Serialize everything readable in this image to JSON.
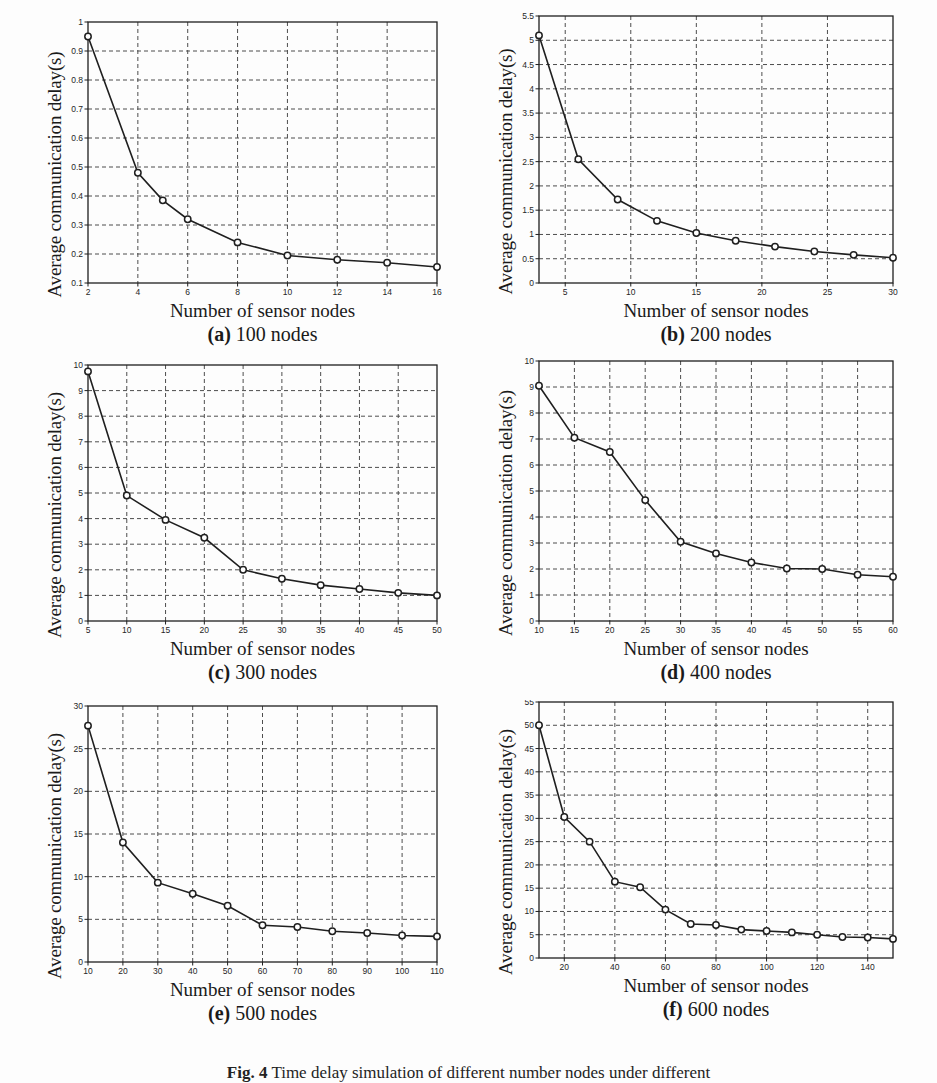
{
  "figure": {
    "caption_label": "Fig. 4",
    "caption_text": "Time delay simulation of different number nodes under different ",
    "background": "#fdfdfd",
    "line_color": "#1f1f1f",
    "grid_color": "#4d4d4d"
  },
  "common": {
    "xlabel": "Number of sensor nodes",
    "ylabel": "Average communication delay(s)"
  },
  "chart_data": [
    {
      "type": "line",
      "panel": "a",
      "sublabel_prefix": "(a)",
      "sublabel_text": " 100 nodes",
      "title": "100 nodes",
      "xlabel": "Number of sensor nodes",
      "ylabel": "Average communication delay(s)",
      "x": [
        2,
        4,
        5,
        6,
        8,
        10,
        12,
        14,
        16
      ],
      "values": [
        0.95,
        0.48,
        0.385,
        0.32,
        0.24,
        0.195,
        0.18,
        0.17,
        0.155
      ],
      "xlim": [
        2,
        16
      ],
      "ylim": [
        0.1,
        1
      ],
      "xticks": [
        2,
        4,
        6,
        8,
        10,
        12,
        14,
        16
      ],
      "xticklabels": [
        "2",
        "4",
        "6",
        "8",
        "10",
        "12",
        "14",
        "16"
      ],
      "yticks": [
        0.1,
        0.2,
        0.3,
        0.4,
        0.5,
        0.6,
        0.7,
        0.8,
        0.9,
        1
      ],
      "yticklabels": [
        "0.1",
        "0.2",
        "0.3",
        "0.4",
        "0.5",
        "0.6",
        "0.7",
        "0.8",
        "0.9",
        "1"
      ],
      "grid": true,
      "marker": "circle",
      "legend": null
    },
    {
      "type": "line",
      "panel": "b",
      "sublabel_prefix": "(b)",
      "sublabel_text": " 200 nodes",
      "title": "200 nodes",
      "xlabel": "Number of sensor nodes",
      "ylabel": "Average communication delay(s)",
      "x": [
        3,
        6,
        9,
        12,
        15,
        18,
        21,
        24,
        27,
        30
      ],
      "values": [
        5.1,
        2.55,
        1.72,
        1.28,
        1.03,
        0.87,
        0.75,
        0.65,
        0.58,
        0.52
      ],
      "xlim": [
        3,
        30
      ],
      "ylim": [
        0,
        5.5
      ],
      "xticks": [
        5,
        10,
        15,
        20,
        25,
        30
      ],
      "xticklabels": [
        "5",
        "10",
        "15",
        "20",
        "25",
        "30"
      ],
      "yticks": [
        0,
        0.5,
        1,
        1.5,
        2,
        2.5,
        3,
        3.5,
        4,
        4.5,
        5,
        5.5
      ],
      "yticklabels": [
        "0",
        "0.5",
        "1",
        "1.5",
        "2",
        "2.5",
        "3",
        "3.5",
        "4",
        "4.5",
        "5",
        "5.5"
      ],
      "grid": true,
      "marker": "circle",
      "legend": null
    },
    {
      "type": "line",
      "panel": "c",
      "sublabel_prefix": "(c)",
      "sublabel_text": " 300 nodes",
      "title": "300 nodes",
      "xlabel": "Number of sensor nodes",
      "ylabel": "Average communication delay(s)",
      "x": [
        5,
        10,
        15,
        20,
        25,
        30,
        35,
        40,
        45,
        50
      ],
      "values": [
        9.75,
        4.9,
        3.95,
        3.25,
        2.0,
        1.65,
        1.4,
        1.25,
        1.1,
        1.0
      ],
      "xlim": [
        5,
        50
      ],
      "ylim": [
        0,
        10
      ],
      "xticks": [
        5,
        10,
        15,
        20,
        25,
        30,
        35,
        40,
        45,
        50
      ],
      "xticklabels": [
        "5",
        "10",
        "15",
        "20",
        "25",
        "30",
        "35",
        "40",
        "45",
        "50"
      ],
      "yticks": [
        0,
        1,
        2,
        3,
        4,
        5,
        6,
        7,
        8,
        9,
        10
      ],
      "yticklabels": [
        "0",
        "1",
        "2",
        "3",
        "4",
        "5",
        "6",
        "7",
        "8",
        "9",
        "10"
      ],
      "grid": true,
      "marker": "circle",
      "legend": null
    },
    {
      "type": "line",
      "panel": "d",
      "sublabel_prefix": "(d)",
      "sublabel_text": " 400 nodes",
      "title": "400 nodes",
      "xlabel": "Number of sensor nodes",
      "ylabel": "Average communication delay(s)",
      "x": [
        10,
        15,
        20,
        25,
        30,
        35,
        40,
        45,
        50,
        55,
        60
      ],
      "values": [
        9.05,
        7.05,
        6.5,
        4.65,
        3.05,
        2.6,
        2.25,
        2.02,
        2.0,
        1.78,
        1.7
      ],
      "xlim": [
        10,
        60
      ],
      "ylim": [
        0,
        10
      ],
      "xticks": [
        10,
        15,
        20,
        25,
        30,
        35,
        40,
        45,
        50,
        55,
        60
      ],
      "xticklabels": [
        "10",
        "15",
        "20",
        "25",
        "30",
        "35",
        "40",
        "45",
        "50",
        "55",
        "60"
      ],
      "yticks": [
        0,
        1,
        2,
        3,
        4,
        5,
        6,
        7,
        8,
        9,
        10
      ],
      "yticklabels": [
        "0",
        "1",
        "2",
        "3",
        "4",
        "5",
        "6",
        "7",
        "8",
        "9",
        "10"
      ],
      "grid": true,
      "marker": "circle",
      "legend": null
    },
    {
      "type": "line",
      "panel": "e",
      "sublabel_prefix": "(e)",
      "sublabel_text": " 500 nodes",
      "title": "500 nodes",
      "xlabel": "Number of sensor nodes",
      "ylabel": "Average communication delay(s)",
      "x": [
        10,
        20,
        30,
        40,
        50,
        60,
        70,
        80,
        90,
        100,
        110
      ],
      "values": [
        27.7,
        14.0,
        9.3,
        8.0,
        6.6,
        4.3,
        4.1,
        3.6,
        3.4,
        3.1,
        3.0
      ],
      "xlim": [
        10,
        110
      ],
      "ylim": [
        0,
        30
      ],
      "xticks": [
        10,
        20,
        30,
        40,
        50,
        60,
        70,
        80,
        90,
        100,
        110
      ],
      "xticklabels": [
        "10",
        "20",
        "30",
        "40",
        "50",
        "60",
        "70",
        "80",
        "90",
        "100",
        "110"
      ],
      "yticks": [
        0,
        5,
        10,
        15,
        20,
        25,
        30
      ],
      "yticklabels": [
        "0",
        "5",
        "10",
        "15",
        "20",
        "25",
        "30"
      ],
      "grid": true,
      "marker": "circle",
      "legend": null
    },
    {
      "type": "line",
      "panel": "f",
      "sublabel_prefix": "(f)",
      "sublabel_text": " 600 nodes",
      "title": "600 nodes",
      "xlabel": "Number of sensor nodes",
      "ylabel": "Average communication delay(s)",
      "x": [
        10,
        20,
        30,
        40,
        50,
        60,
        70,
        80,
        90,
        100,
        110,
        120,
        130,
        140,
        150
      ],
      "values": [
        50.0,
        30.3,
        25.0,
        16.4,
        15.2,
        10.4,
        7.3,
        7.1,
        6.1,
        5.8,
        5.5,
        5.0,
        4.5,
        4.4,
        4.1
      ],
      "xlim": [
        10,
        150
      ],
      "ylim": [
        0,
        55
      ],
      "xticks": [
        20,
        40,
        60,
        80,
        100,
        120,
        140
      ],
      "xticklabels": [
        "20",
        "40",
        "60",
        "80",
        "100",
        "120",
        "140"
      ],
      "yticks": [
        0,
        5,
        10,
        15,
        20,
        25,
        30,
        35,
        40,
        45,
        50,
        55
      ],
      "yticklabels": [
        "0",
        "5",
        "10",
        "15",
        "20",
        "25",
        "30",
        "35",
        "40",
        "45",
        "50",
        "55"
      ],
      "grid": true,
      "marker": "circle",
      "legend": null
    }
  ]
}
